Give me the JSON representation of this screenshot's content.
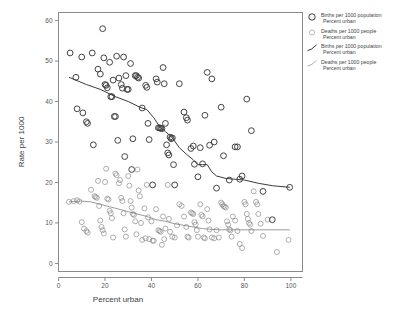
{
  "chart_data": {
    "type": "scatter",
    "title": "",
    "xlabel": "Percent urban",
    "ylabel": "Rate per 1000",
    "xlim": [
      0,
      105
    ],
    "ylim": [
      -2,
      62
    ],
    "xticks": [
      0,
      20,
      40,
      60,
      80,
      100
    ],
    "yticks": [
      0,
      10,
      20,
      30,
      40,
      50,
      60
    ],
    "grid": false,
    "legend_position": "right-top",
    "legend": [
      {
        "marker": "open-circle-large",
        "label_line1": "Births per 1000 population",
        "label_line2": "Percent urban"
      },
      {
        "marker": "open-circle-small",
        "label_line1": "Deaths per 1000 people",
        "label_line2": "Percent urban"
      },
      {
        "marker": "curve-dark",
        "label_line1": "Births per 1000 population",
        "label_line2": "Percent urban"
      },
      {
        "marker": "curve-light",
        "label_line1": "Deaths per 1000 people",
        "label_line2": "Percent urban"
      }
    ],
    "series": [
      {
        "name": "Births per 1000 population",
        "marker": "open-circle-large",
        "color": "#3a3a3a",
        "points": [
          [
            5.0,
            52.0
          ],
          [
            7.5,
            46.0
          ],
          [
            8.0,
            38.2
          ],
          [
            10.0,
            51.0
          ],
          [
            10.5,
            37.2
          ],
          [
            12.0,
            35.0
          ],
          [
            12.5,
            34.6
          ],
          [
            14.5,
            52.0
          ],
          [
            15.0,
            29.3
          ],
          [
            17.0,
            48.0
          ],
          [
            18.0,
            46.8
          ],
          [
            19.0,
            58.0
          ],
          [
            19.5,
            50.8
          ],
          [
            20.0,
            44.2
          ],
          [
            20.5,
            44.0
          ],
          [
            21.0,
            43.4
          ],
          [
            22.0,
            49.7
          ],
          [
            22.5,
            41.2
          ],
          [
            23.0,
            41.2
          ],
          [
            23.5,
            45.3
          ],
          [
            24.0,
            36.3
          ],
          [
            24.5,
            36.3
          ],
          [
            25.0,
            51.2
          ],
          [
            25.5,
            30.4
          ],
          [
            26.0,
            45.8
          ],
          [
            27.0,
            44.2
          ],
          [
            27.5,
            43.3
          ],
          [
            28.0,
            51.0
          ],
          [
            28.5,
            26.4
          ],
          [
            29.0,
            46.4
          ],
          [
            29.5,
            43.0
          ],
          [
            30.0,
            43.0
          ],
          [
            31.0,
            49.4
          ],
          [
            31.5,
            23.2
          ],
          [
            32.0,
            30.8
          ],
          [
            33.0,
            46.4
          ],
          [
            33.5,
            46.4
          ],
          [
            34.0,
            46.0
          ],
          [
            34.5,
            45.8
          ],
          [
            36.0,
            38.4
          ],
          [
            37.5,
            44.0
          ],
          [
            38.0,
            43.5
          ],
          [
            38.5,
            34.6
          ],
          [
            39.0,
            30.6
          ],
          [
            40.5,
            19.4
          ],
          [
            42.0,
            45.6
          ],
          [
            42.5,
            44.8
          ],
          [
            43.0,
            33.5
          ],
          [
            43.5,
            33.5
          ],
          [
            44.0,
            33.4
          ],
          [
            44.5,
            33.3
          ],
          [
            45.0,
            48.4
          ],
          [
            45.5,
            44.4
          ],
          [
            46.0,
            34.6
          ],
          [
            46.5,
            29.3
          ],
          [
            47.0,
            27.3
          ],
          [
            47.5,
            26.8
          ],
          [
            48.0,
            31.2
          ],
          [
            48.5,
            30.8
          ],
          [
            49.0,
            31.0
          ],
          [
            49.5,
            24.4
          ],
          [
            50.0,
            19.4
          ],
          [
            52.0,
            44.4
          ],
          [
            54.0,
            37.4
          ],
          [
            55.0,
            36.0
          ],
          [
            55.5,
            35.4
          ],
          [
            57.0,
            28.4
          ],
          [
            58.0,
            29.0
          ],
          [
            58.5,
            24.5
          ],
          [
            60.0,
            21.4
          ],
          [
            61.0,
            28.6
          ],
          [
            62.0,
            24.6
          ],
          [
            63.0,
            36.6
          ],
          [
            64.0,
            47.2
          ],
          [
            65.0,
            29.2
          ],
          [
            66.0,
            45.6
          ],
          [
            67.0,
            30.0
          ],
          [
            68.0,
            18.6
          ],
          [
            70.0,
            38.6
          ],
          [
            71.0,
            26.6
          ],
          [
            73.5,
            20.6
          ],
          [
            76.0,
            28.8
          ],
          [
            77.0,
            28.8
          ],
          [
            78.0,
            20.8
          ],
          [
            79.0,
            21.6
          ],
          [
            81.0,
            40.6
          ],
          [
            83.0,
            32.8
          ],
          [
            88.0,
            17.8
          ],
          [
            92.0,
            10.8
          ],
          [
            99.5,
            18.8
          ]
        ]
      },
      {
        "name": "Deaths per 1000 people",
        "marker": "open-circle-small",
        "color": "#8c8c8c",
        "points": [
          [
            4.5,
            15.2
          ],
          [
            6.5,
            15.4
          ],
          [
            8.0,
            15.6
          ],
          [
            9.0,
            15.3
          ],
          [
            10.0,
            10.2
          ],
          [
            11.0,
            8.6
          ],
          [
            12.0,
            8.0
          ],
          [
            12.5,
            7.6
          ],
          [
            14.0,
            18.2
          ],
          [
            15.5,
            16.6
          ],
          [
            16.0,
            16.4
          ],
          [
            16.5,
            16.2
          ],
          [
            17.0,
            20.4
          ],
          [
            17.5,
            14.2
          ],
          [
            18.0,
            10.6
          ],
          [
            18.5,
            9.0
          ],
          [
            19.0,
            8.2
          ],
          [
            19.5,
            7.4
          ],
          [
            20.0,
            20.1
          ],
          [
            20.5,
            23.4
          ],
          [
            21.0,
            16.0
          ],
          [
            21.5,
            15.8
          ],
          [
            22.0,
            13.0
          ],
          [
            22.5,
            12.4
          ],
          [
            23.0,
            11.2
          ],
          [
            23.5,
            6.4
          ],
          [
            24.5,
            22.2
          ],
          [
            25.0,
            21.8
          ],
          [
            26.0,
            19.8
          ],
          [
            26.5,
            20.6
          ],
          [
            27.0,
            16.2
          ],
          [
            27.5,
            15.4
          ],
          [
            28.0,
            12.4
          ],
          [
            28.5,
            8.4
          ],
          [
            29.0,
            6.6
          ],
          [
            30.0,
            21.6
          ],
          [
            30.5,
            19.2
          ],
          [
            31.0,
            15.4
          ],
          [
            31.5,
            13.8
          ],
          [
            32.0,
            12.2
          ],
          [
            32.5,
            12.0
          ],
          [
            33.0,
            10.4
          ],
          [
            33.5,
            7.2
          ],
          [
            34.0,
            23.2
          ],
          [
            34.5,
            18.0
          ],
          [
            35.0,
            16.6
          ],
          [
            35.5,
            10.0
          ],
          [
            36.0,
            5.8
          ],
          [
            37.0,
            13.6
          ],
          [
            37.5,
            6.2
          ],
          [
            38.0,
            19.4
          ],
          [
            38.5,
            11.4
          ],
          [
            39.0,
            6.0
          ],
          [
            40.0,
            10.4
          ],
          [
            40.5,
            5.6
          ],
          [
            41.0,
            5.6
          ],
          [
            42.0,
            13.4
          ],
          [
            43.0,
            8.2
          ],
          [
            43.5,
            8.0
          ],
          [
            44.0,
            7.8
          ],
          [
            44.5,
            4.6
          ],
          [
            45.0,
            11.6
          ],
          [
            45.5,
            6.0
          ],
          [
            46.0,
            8.6
          ],
          [
            47.0,
            19.4
          ],
          [
            47.5,
            11.0
          ],
          [
            48.0,
            7.8
          ],
          [
            49.0,
            6.6
          ],
          [
            50.0,
            6.4
          ],
          [
            51.0,
            9.4
          ],
          [
            52.0,
            14.6
          ],
          [
            53.0,
            14.2
          ],
          [
            54.0,
            11.6
          ],
          [
            55.0,
            9.0
          ],
          [
            55.5,
            6.6
          ],
          [
            56.0,
            6.4
          ],
          [
            57.0,
            12.6
          ],
          [
            57.5,
            12.4
          ],
          [
            58.0,
            12.2
          ],
          [
            58.5,
            10.2
          ],
          [
            59.0,
            9.6
          ],
          [
            59.5,
            8.2
          ],
          [
            60.0,
            6.6
          ],
          [
            61.0,
            14.6
          ],
          [
            61.5,
            12.0
          ],
          [
            62.0,
            11.6
          ],
          [
            62.5,
            6.4
          ],
          [
            63.0,
            6.2
          ],
          [
            64.0,
            13.4
          ],
          [
            64.5,
            10.6
          ],
          [
            65.0,
            8.4
          ],
          [
            66.0,
            6.4
          ],
          [
            67.0,
            6.2
          ],
          [
            68.0,
            8.2
          ],
          [
            69.0,
            6.4
          ],
          [
            70.0,
            15.0
          ],
          [
            70.5,
            14.6
          ],
          [
            71.0,
            14.2
          ],
          [
            71.5,
            14.0
          ],
          [
            72.0,
            13.8
          ],
          [
            72.5,
            10.4
          ],
          [
            73.0,
            9.6
          ],
          [
            73.5,
            8.4
          ],
          [
            74.0,
            8.2
          ],
          [
            74.5,
            6.6
          ],
          [
            75.0,
            11.6
          ],
          [
            76.0,
            10.6
          ],
          [
            77.0,
            8.0
          ],
          [
            78.0,
            4.8
          ],
          [
            79.0,
            3.8
          ],
          [
            80.0,
            15.2
          ],
          [
            80.5,
            14.6
          ],
          [
            81.0,
            12.2
          ],
          [
            81.5,
            11.0
          ],
          [
            82.0,
            10.0
          ],
          [
            82.5,
            9.6
          ],
          [
            83.0,
            8.0
          ],
          [
            84.0,
            17.8
          ],
          [
            85.0,
            15.2
          ],
          [
            85.5,
            14.6
          ],
          [
            86.0,
            12.2
          ],
          [
            87.0,
            9.8
          ],
          [
            88.0,
            6.8
          ],
          [
            90.0,
            10.8
          ],
          [
            94.0,
            2.8
          ],
          [
            99.0,
            5.8
          ]
        ]
      }
    ],
    "fit_lines": [
      {
        "name": "Births per 1000 population",
        "style": "dark",
        "color": "#3a3a3a",
        "points": [
          [
            4.5,
            46.0
          ],
          [
            12.0,
            44.2
          ],
          [
            18.0,
            43.0
          ],
          [
            24.5,
            41.2
          ],
          [
            30.0,
            40.0
          ],
          [
            35.0,
            38.6
          ],
          [
            38.0,
            38.0
          ],
          [
            41.0,
            36.0
          ],
          [
            44.0,
            33.4
          ],
          [
            46.0,
            32.6
          ],
          [
            49.0,
            31.0
          ],
          [
            52.0,
            28.6
          ],
          [
            55.0,
            27.0
          ],
          [
            58.0,
            25.6
          ],
          [
            60.0,
            24.4
          ],
          [
            62.0,
            24.4
          ],
          [
            64.0,
            24.4
          ],
          [
            66.0,
            22.6
          ],
          [
            68.0,
            21.6
          ],
          [
            72.0,
            21.0
          ],
          [
            76.0,
            20.8
          ],
          [
            80.0,
            20.6
          ],
          [
            86.0,
            19.8
          ],
          [
            92.0,
            19.2
          ],
          [
            99.5,
            18.8
          ]
        ]
      },
      {
        "name": "Deaths per 1000 people",
        "style": "light",
        "color": "#7a7a7a",
        "points": [
          [
            4.5,
            15.2
          ],
          [
            10.0,
            15.4
          ],
          [
            14.0,
            15.2
          ],
          [
            18.0,
            14.6
          ],
          [
            22.0,
            14.0
          ],
          [
            26.0,
            13.4
          ],
          [
            30.0,
            12.8
          ],
          [
            34.0,
            12.2
          ],
          [
            38.0,
            11.6
          ],
          [
            42.0,
            10.8
          ],
          [
            46.0,
            10.4
          ],
          [
            50.0,
            9.8
          ],
          [
            54.0,
            9.4
          ],
          [
            58.0,
            9.0
          ],
          [
            62.0,
            8.6
          ],
          [
            66.0,
            8.4
          ],
          [
            70.0,
            8.3
          ],
          [
            76.0,
            8.3
          ],
          [
            82.0,
            8.3
          ],
          [
            90.0,
            8.3
          ],
          [
            99.5,
            8.3
          ]
        ]
      }
    ]
  }
}
